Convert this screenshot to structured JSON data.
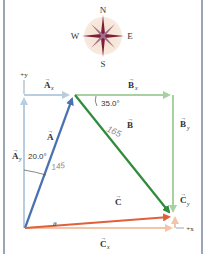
{
  "compass": {
    "north": "N",
    "south": "S",
    "west": "W",
    "east": "E"
  },
  "axes": {
    "y_label": "+y",
    "x_label": "+x"
  },
  "vectors": {
    "A": {
      "label": "A",
      "color": "#4a72b0"
    },
    "Ax": {
      "label": "A",
      "subscript": "x",
      "color": "#b8cde0"
    },
    "Ay": {
      "label": "A",
      "subscript": "y",
      "color": "#b8cde0"
    },
    "B": {
      "label": "B",
      "color": "#2e8b3a"
    },
    "Bx": {
      "label": "B",
      "subscript": "x",
      "color": "#a8d0a0"
    },
    "By": {
      "label": "B",
      "subscript": "y",
      "color": "#a8d0a0"
    },
    "C": {
      "label": "C",
      "color": "#e0603a"
    },
    "Cx": {
      "label": "C",
      "subscript": "x",
      "color": "#f2c4a8"
    },
    "Cy": {
      "label": "C",
      "subscript": "y",
      "color": "#f2c4a8"
    }
  },
  "angles": {
    "A_angle": "20.0°",
    "B_angle": "35.0°",
    "C_angle": "θ"
  },
  "annotations": {
    "A_magnitude_handwritten": "145",
    "B_magnitude_handwritten": "165"
  }
}
